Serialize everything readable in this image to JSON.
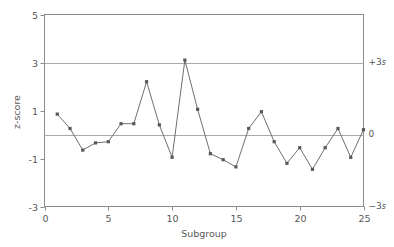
{
  "chart_data": {
    "type": "line",
    "title": "",
    "xlabel": "Subgroup",
    "ylabel": "z-score",
    "xlim": [
      0,
      25
    ],
    "ylim": [
      -3,
      5
    ],
    "grid": false,
    "legend": "none",
    "x_ticks": [
      "0",
      "5",
      "10",
      "15",
      "20",
      "25"
    ],
    "x_tick_values": [
      0,
      5,
      10,
      15,
      20,
      25
    ],
    "y_ticks": [
      "5",
      "3",
      "1",
      "-1",
      "-3"
    ],
    "y_tick_values": [
      5,
      3,
      1,
      -1,
      -3
    ],
    "x": [
      1,
      2,
      3,
      4,
      5,
      6,
      7,
      8,
      9,
      10,
      11,
      12,
      13,
      14,
      15,
      16,
      17,
      18,
      19,
      20,
      21,
      22,
      23,
      24,
      25
    ],
    "values": [
      0.85,
      0.25,
      -0.65,
      -0.35,
      -0.3,
      0.45,
      0.45,
      2.2,
      0.4,
      -0.95,
      3.1,
      1.05,
      -0.8,
      -1.05,
      -1.35,
      0.25,
      0.95,
      -0.3,
      -1.2,
      -0.55,
      -1.45,
      -0.55,
      0.25,
      -0.95,
      0.2
    ],
    "series_name": "z-score",
    "reference_lines": [
      {
        "name": "upper-control-limit",
        "value": 3,
        "label": "+3s",
        "label_text": "+3",
        "label_sigma": "s"
      },
      {
        "name": "center-line",
        "value": 0,
        "label": "0",
        "label_text": "0",
        "label_sigma": ""
      },
      {
        "name": "lower-control-limit",
        "value": -3,
        "label": "-3s",
        "label_text": "−3",
        "label_sigma": "s"
      }
    ],
    "colors": {
      "line": "#6f6f72",
      "marker": "#58585a",
      "axis": "#8c8c8e",
      "reference_line": "#a9a9ab",
      "text": "#58585a",
      "background": "#ffffff"
    }
  }
}
